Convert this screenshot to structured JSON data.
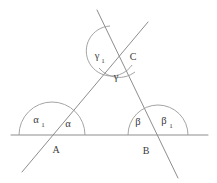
{
  "figure": {
    "stroke_color": "#8d8d8d",
    "arc_color": "#9a9a9a",
    "label_color": "#3a3a3a",
    "background": "#ffffff",
    "vertices": [
      {
        "name": "A",
        "label": "A",
        "x": 52,
        "y": 135,
        "label_x": 56,
        "label_y": 150
      },
      {
        "name": "B",
        "label": "B",
        "x": 145,
        "y": 135,
        "label_x": 146,
        "label_y": 151
      },
      {
        "name": "C",
        "label": "C",
        "x": 118,
        "y": 52,
        "label_x": 133,
        "label_y": 58
      }
    ],
    "angles": [
      {
        "name": "alpha-1",
        "label": "α",
        "sub": "1",
        "x": 38,
        "y": 121,
        "vertex": "A",
        "kind": "exterior"
      },
      {
        "name": "alpha",
        "label": "α",
        "sub": "",
        "x": 68,
        "y": 124,
        "vertex": "A",
        "kind": "interior"
      },
      {
        "name": "beta",
        "label": "β",
        "sub": "",
        "x": 138,
        "y": 122,
        "vertex": "B",
        "kind": "interior"
      },
      {
        "name": "beta-1",
        "label": "β",
        "sub": "1",
        "x": 166,
        "y": 122,
        "vertex": "B",
        "kind": "exterior"
      },
      {
        "name": "gamma-1",
        "label": "γ",
        "sub": "1",
        "x": 99,
        "y": 57,
        "vertex": "C",
        "kind": "exterior"
      },
      {
        "name": "gamma",
        "label": "γ",
        "sub": "",
        "x": 116,
        "y": 77,
        "vertex": "C",
        "kind": "interior"
      }
    ],
    "baseline": {
      "name": "baseline",
      "x1": 11,
      "y1": 135,
      "x2": 208,
      "y2": 135
    },
    "rays": [
      {
        "name": "line-through-A-and-C",
        "x1": 148,
        "y1": 22,
        "x2": 22,
        "y2": 172
      },
      {
        "name": "line-through-C-and-B",
        "x1": 97,
        "y1": 10,
        "x2": 178,
        "y2": 178
      }
    ],
    "arcs": [
      {
        "name": "arc-at-A",
        "d": "M 19 135 A 33 33 0 0 1 85 135"
      },
      {
        "name": "arc-at-B",
        "d": "M 128 135 A 30 30 0 0 1 188 135"
      },
      {
        "name": "arc-gamma-1-at-C",
        "d": "M 107 27 A 24 24 0 1 0 131 66"
      },
      {
        "name": "arc-gamma-at-C",
        "d": "M 100 66 A 24 24 0 0 0 134 71"
      }
    ]
  }
}
